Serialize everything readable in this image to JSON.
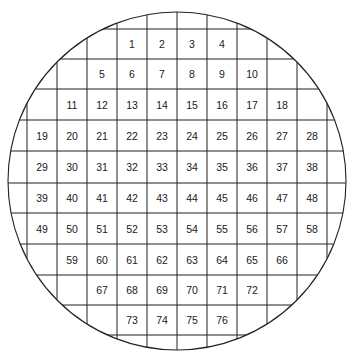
{
  "diagram": {
    "title": "",
    "type": "wafer-die-map",
    "colors": {
      "line": "#222222",
      "text": "#1a1a1a",
      "background": "#ffffff"
    },
    "circle": {
      "cx": 177,
      "cy": 181,
      "r": 169
    },
    "grid": {
      "x_lines": [
        27,
        57,
        87,
        117,
        147,
        177,
        207,
        237,
        267,
        297,
        327
      ],
      "y_lines": [
        29,
        59,
        89,
        120,
        151,
        183,
        213,
        244,
        275,
        305,
        335
      ]
    },
    "rows": [
      {
        "row": 0,
        "start_col": 4,
        "dies": [
          "1",
          "2",
          "3",
          "4"
        ]
      },
      {
        "row": 1,
        "start_col": 3,
        "dies": [
          "5",
          "6",
          "7",
          "8",
          "9",
          "10"
        ]
      },
      {
        "row": 2,
        "start_col": 2,
        "dies": [
          "11",
          "12",
          "13",
          "14",
          "15",
          "16",
          "17",
          "18"
        ]
      },
      {
        "row": 3,
        "start_col": 1,
        "dies": [
          "19",
          "20",
          "21",
          "22",
          "23",
          "24",
          "25",
          "26",
          "27",
          "28"
        ]
      },
      {
        "row": 4,
        "start_col": 1,
        "dies": [
          "29",
          "30",
          "31",
          "32",
          "33",
          "34",
          "35",
          "36",
          "37",
          "38"
        ]
      },
      {
        "row": 5,
        "start_col": 1,
        "dies": [
          "39",
          "40",
          "41",
          "42",
          "43",
          "44",
          "45",
          "46",
          "47",
          "48"
        ]
      },
      {
        "row": 6,
        "start_col": 1,
        "dies": [
          "49",
          "50",
          "51",
          "52",
          "53",
          "54",
          "55",
          "56",
          "57",
          "58"
        ]
      },
      {
        "row": 7,
        "start_col": 2,
        "dies": [
          "59",
          "60",
          "61",
          "62",
          "63",
          "64",
          "65",
          "66"
        ]
      },
      {
        "row": 8,
        "start_col": 3,
        "dies": [
          "67",
          "68",
          "69",
          "70",
          "71",
          "72"
        ]
      },
      {
        "row": 9,
        "start_col": 4,
        "dies": [
          "73",
          "74",
          "75",
          "76"
        ]
      }
    ],
    "total_dies": 76
  }
}
